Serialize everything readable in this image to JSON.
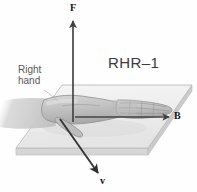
{
  "figure": {
    "kind": "right-hand-rule-diagram",
    "background_color": "#fefefe"
  },
  "labels": {
    "rhr": "RHR–1",
    "right_hand_line1": "Right",
    "right_hand_line2": "hand",
    "force_vector": "F",
    "magnetic_field_vector": "B",
    "velocity_vector": "v"
  },
  "vectors": [
    {
      "name": "force",
      "label": "F",
      "direction": "up",
      "color": "#444444",
      "start": [
        73,
        122
      ],
      "end": [
        73,
        20
      ]
    },
    {
      "name": "magnetic-field",
      "label": "B",
      "direction": "right",
      "color": "#444444",
      "start": [
        74,
        117
      ],
      "end": [
        170,
        117
      ]
    },
    {
      "name": "velocity",
      "label": "v",
      "direction": "down-right-out-of-plane",
      "color": "#333333",
      "start": [
        60,
        119
      ],
      "end": [
        99,
        174
      ]
    }
  ],
  "plane": {
    "name": "reference-plane",
    "fill_color": "#efefef",
    "edge_color": "#b9b9b9",
    "side_color": "#d8d8d8",
    "corners_top": [
      [
        62,
        85
      ],
      [
        192,
        85
      ],
      [
        148,
        148
      ],
      [
        16,
        148
      ]
    ],
    "thickness_px": 7
  },
  "hand": {
    "name": "right-hand-illustration",
    "fill_color": "#c9c9c9",
    "outline_color": "#9a9a9a",
    "palm_down": true,
    "fingers_point": "right (along B)",
    "thumb_points": "down-right (along v)"
  },
  "colors": {
    "text_dark": "#111111",
    "text_gray": "#585858",
    "title_gray": "#3a3a3a"
  }
}
